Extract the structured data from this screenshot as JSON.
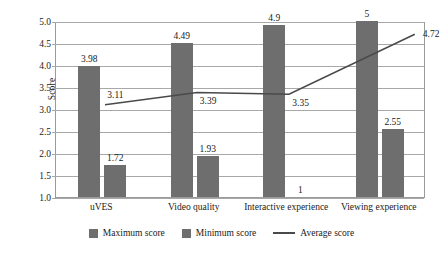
{
  "chart_data": {
    "type": "bar",
    "title": "",
    "xlabel": "",
    "ylabel": "Score",
    "ylim": [
      1.0,
      5.0
    ],
    "ystep": 0.5,
    "grid": true,
    "legend_position": "bottom",
    "categories": [
      "uVES",
      "Video quality",
      "Interactive experience",
      "Viewing experience"
    ],
    "series": [
      {
        "name": "Maximum score",
        "type": "bar",
        "color": "#6e6e6e",
        "values": [
          3.98,
          4.49,
          4.9,
          5
        ],
        "labels": [
          "3.98",
          "4.49",
          "4.9",
          "5"
        ]
      },
      {
        "name": "Minimum score",
        "type": "bar",
        "color": "#6e6e6e",
        "values": [
          1.72,
          1.93,
          1,
          2.55
        ],
        "labels": [
          "1.72",
          "1.93",
          "1",
          "2.55"
        ]
      },
      {
        "name": "Average score",
        "type": "line",
        "color": "#4a4a4a",
        "values": [
          3.11,
          3.39,
          3.35,
          4.72
        ],
        "labels": [
          "3.11",
          "3.39",
          "3.35",
          "4.72"
        ]
      }
    ],
    "yticks": [
      "5.0",
      "4.5",
      "4.0",
      "3.5",
      "3.0",
      "2.5",
      "2.0",
      "1.5",
      "1.0"
    ]
  },
  "axis": {
    "y_title": "Score"
  },
  "legend": {
    "items": [
      {
        "label": "Maximum score",
        "marker": "square-swatch"
      },
      {
        "label": "Minimum score",
        "marker": "square-swatch"
      },
      {
        "label": "Average score",
        "marker": "line-swatch"
      }
    ]
  }
}
